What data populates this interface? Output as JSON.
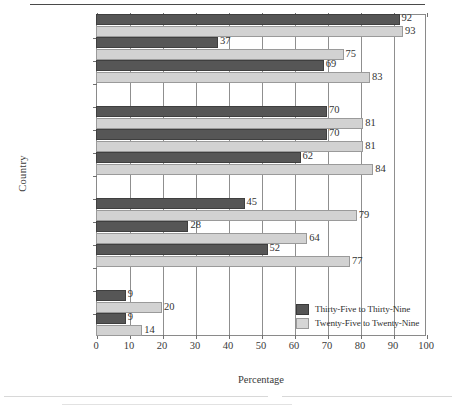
{
  "axis": {
    "ylabel": "Country",
    "xlabel": "Percentage"
  },
  "legend": {
    "items": [
      {
        "label": "Thirty-Five to Thirty-Nine",
        "color": "#565656",
        "key": "thirty_five_to_thirty_nine"
      },
      {
        "label": "Twenty-Five to Twenty-Nine",
        "color": "#d6d6d6",
        "key": "twenty_five_to_twenty_nine"
      }
    ]
  },
  "chart_data": {
    "type": "bar",
    "orientation": "horizontal",
    "title": "",
    "xlabel": "Percentage",
    "ylabel": "Country",
    "xlim": [
      0,
      100
    ],
    "xticks": [
      0,
      10,
      20,
      30,
      40,
      50,
      60,
      70,
      80,
      90,
      100
    ],
    "grid": true,
    "legend_position": "inside-bottom-right",
    "categories": [
      "Sweden",
      "Norway",
      "Finland",
      "Austria",
      "Switzerland",
      "West Germany",
      "France",
      "Great Britain",
      "United States",
      "Spain",
      "Italy"
    ],
    "group_breaks_after": [
      "Finland",
      "West Germany",
      "United States"
    ],
    "series": [
      {
        "name": "Thirty-Five to Thirty-Nine",
        "color": "#565656",
        "values": [
          92,
          37,
          69,
          70,
          70,
          62,
          45,
          28,
          52,
          9,
          9
        ]
      },
      {
        "name": "Twenty-Five to Twenty-Nine",
        "color": "#d2d2d2",
        "values": [
          93,
          75,
          83,
          81,
          81,
          84,
          79,
          64,
          77,
          20,
          14
        ]
      }
    ]
  }
}
